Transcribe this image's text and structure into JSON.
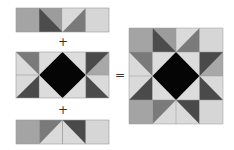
{
  "diagram": {
    "operators": {
      "plus_1": "+",
      "plus_2": "+",
      "equals": "="
    },
    "colors": {
      "light": "#dcdcdc",
      "medium": "#a6a6a6",
      "mid_dark": "#7c7c7c",
      "dark": "#4a4a4a",
      "black": "#050505",
      "seam": "#9a9a9a"
    },
    "parts": [
      {
        "name": "top-strip",
        "rows": 1,
        "cols": 4
      },
      {
        "name": "middle-strip",
        "rows": 2,
        "cols": 4
      },
      {
        "name": "bottom-strip",
        "rows": 1,
        "cols": 4
      },
      {
        "name": "finished-block",
        "rows": 4,
        "cols": 4
      }
    ]
  }
}
